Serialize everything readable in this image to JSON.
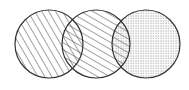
{
  "diagram": {
    "type": "venn",
    "background": "#ffffff",
    "stroke_color": "#333333",
    "circles": [
      {
        "id": "circle-left",
        "cx": 49,
        "cy": 44,
        "r": 34,
        "pattern": "diagonal-steep-hatch"
      },
      {
        "id": "circle-middle",
        "cx": 96,
        "cy": 44,
        "r": 34,
        "pattern": "diagonal-shallow-hatch"
      },
      {
        "id": "circle-right",
        "cx": 146,
        "cy": 44,
        "r": 34,
        "pattern": "dotted"
      }
    ]
  }
}
